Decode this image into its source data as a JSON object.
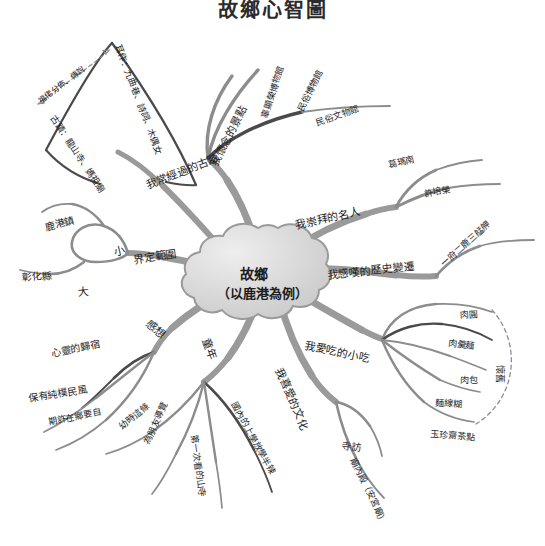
{
  "title": "故鄉心智圖",
  "center": {
    "line1": "故鄉",
    "line2": "（以鹿港為例）"
  },
  "colors": {
    "branch_gray": "#8c8c8c",
    "branch_dark": "#4a4a4a",
    "node_fill": "#d8d8d8",
    "node_stroke": "#9a9a9a",
    "text": "#1d1d1d"
  },
  "branches": [
    {
      "id": "branch-scope",
      "label": "界定範圍",
      "children": [
        {
          "label": "小",
          "children": [
            {
              "label": "鹿港鎮"
            }
          ]
        },
        {
          "label": "大",
          "children": [
            {
              "label": "彰化縣"
            }
          ]
        }
      ]
    },
    {
      "id": "branch-ancient-sites",
      "label": "我常經過的古蹟",
      "children": [
        {
          "label": "古蹟：龍山寺、媽祖廟"
        },
        {
          "label": "耳作：九曲巷、詩詞、木偶女"
        },
        {
          "label": "福佬分佈、傳說"
        }
      ]
    },
    {
      "id": "branch-scenery",
      "label": "我懷念的景點",
      "children": [
        {
          "label": "辜顯榮博物館"
        },
        {
          "label": "民俗博物館"
        },
        {
          "label": "民俗文物館"
        }
      ]
    },
    {
      "id": "branch-famous",
      "label": "我崇拜的名人",
      "children": [
        {
          "label": "葛瑪南"
        },
        {
          "label": "許培榮"
        }
      ]
    },
    {
      "id": "branch-history",
      "label": "我感嘆的歷史變遷",
      "children": [
        {
          "label": "一府二鹿三艋舺"
        }
      ]
    },
    {
      "id": "branch-snacks",
      "label": "我愛吃的小吃",
      "children": [
        {
          "label": "肉圓"
        },
        {
          "label": "肉羹麵"
        },
        {
          "label": "肉包"
        },
        {
          "label": "麵線糊"
        },
        {
          "label": "玉珍齋茶點"
        },
        {
          "label": "懷舊"
        }
      ]
    },
    {
      "id": "branch-culture",
      "label": "我喜愛的文化",
      "children": [
        {
          "label": "寺訪"
        },
        {
          "label": "廟內殿（安宮廟）"
        }
      ]
    },
    {
      "id": "branch-memory",
      "label": "童年",
      "children": [
        {
          "label": "國內的上學放學半辣"
        },
        {
          "label": "第一次看的山寺"
        },
        {
          "label": "為朋友導覽"
        },
        {
          "label": "幼時這條"
        }
      ]
    },
    {
      "id": "branch-feelings",
      "label": "感想",
      "children": [
        {
          "label": "心靈的歸宿"
        },
        {
          "label": "保有純樸民風"
        },
        {
          "label": "期許在鄉要自"
        }
      ]
    }
  ]
}
